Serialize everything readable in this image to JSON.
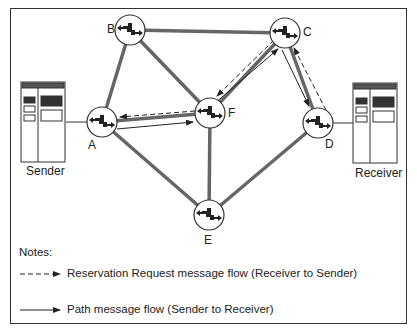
{
  "diagram": {
    "nodes": [
      {
        "id": "A",
        "label": "A",
        "type": "router"
      },
      {
        "id": "B",
        "label": "B",
        "type": "router"
      },
      {
        "id": "C",
        "label": "C",
        "type": "router"
      },
      {
        "id": "D",
        "label": "D",
        "type": "router"
      },
      {
        "id": "E",
        "label": "E",
        "type": "router"
      },
      {
        "id": "F",
        "label": "F",
        "type": "router"
      }
    ],
    "hosts": {
      "sender": {
        "label": "Sender",
        "connected_to": "A"
      },
      "receiver": {
        "label": "Receiver",
        "connected_to": "D"
      }
    },
    "links": [
      [
        "A",
        "B"
      ],
      [
        "B",
        "C"
      ],
      [
        "B",
        "F"
      ],
      [
        "A",
        "F"
      ],
      [
        "A",
        "E"
      ],
      [
        "F",
        "E"
      ],
      [
        "F",
        "C"
      ],
      [
        "C",
        "D"
      ],
      [
        "D",
        "E"
      ]
    ],
    "path_flow": [
      "A",
      "F",
      "C",
      "D"
    ],
    "reservation_flow": [
      "D",
      "C",
      "F",
      "A"
    ]
  },
  "notes": {
    "title": "Notes:",
    "legend": [
      {
        "style": "dashed-arrow",
        "text": "Reservation Request message flow (Receiver to Sender)"
      },
      {
        "style": "solid-arrow",
        "text": "Path message flow (Sender to Receiver)"
      }
    ]
  }
}
